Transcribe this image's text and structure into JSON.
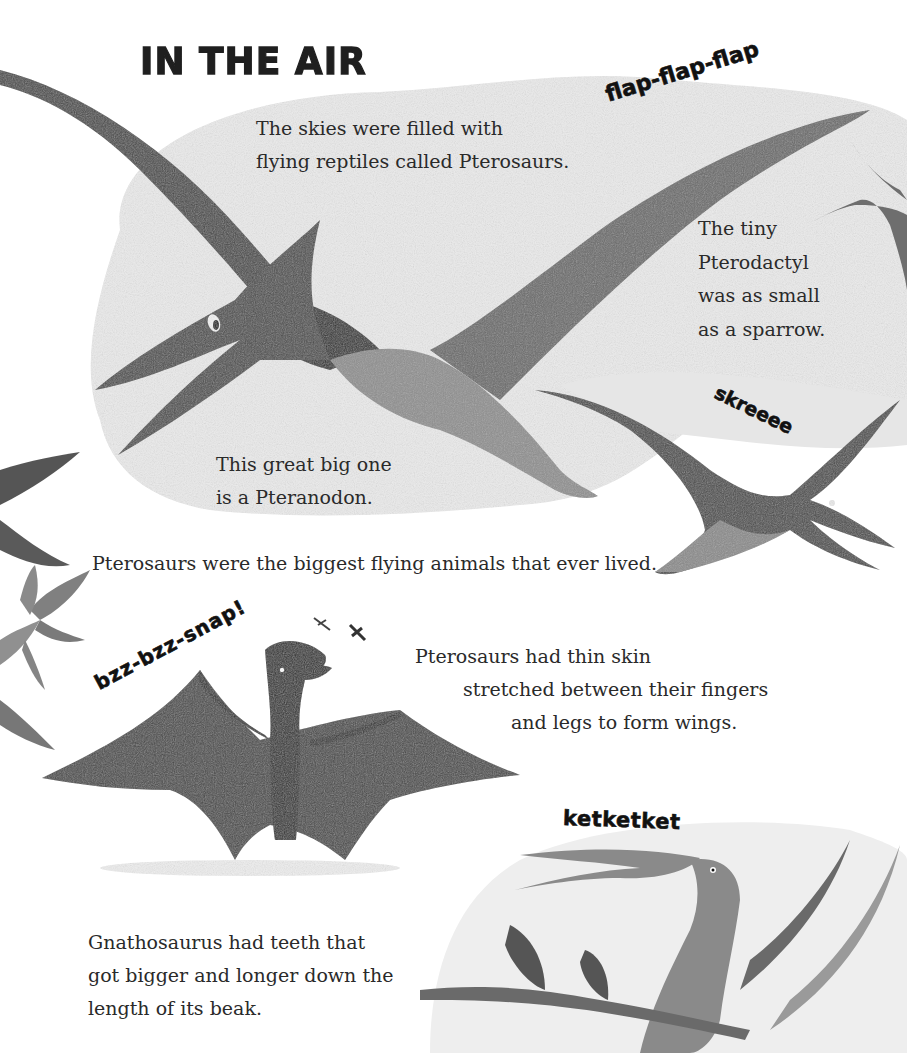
{
  "page": {
    "title": "IN THE AIR",
    "sound_effects": {
      "pteranodon": "flap-flap-flap",
      "flying_pterosaur": "skreeee",
      "dimorphodon": "bzz-bzz-snap!",
      "gnathosaurus": "ketketket"
    },
    "captions": {
      "intro": [
        "The skies were filled with",
        "flying reptiles called Pterosaurs."
      ],
      "pterodactyl": [
        "The tiny",
        "Pterodactyl",
        "was as small",
        "as a sparrow."
      ],
      "pteranodon": [
        "This great big one",
        "is a Pteranodon."
      ],
      "biggest": "Pterosaurs were the biggest flying animals that ever lived.",
      "wings": [
        "Pterosaurs had thin skin",
        "stretched between their fingers",
        "and legs to form wings."
      ],
      "gnathosaurus": [
        "Gnathosaurus had teeth that",
        "got bigger and longer down the",
        "length of its beak."
      ]
    },
    "illustrations": [
      "pteranodon",
      "pterodactyl",
      "flying-pterosaur",
      "standing-pterosaur",
      "dragonflies",
      "gnathosaurus",
      "palm-leaves",
      "sky-cloud"
    ],
    "colors": {
      "background": "#ffffff",
      "cloud": "#e9e9e9",
      "dark_wing": "#3f3f3f",
      "body": "#5a5a5a",
      "light_body": "#8a8a8a",
      "text": "#2a2a2a"
    }
  }
}
